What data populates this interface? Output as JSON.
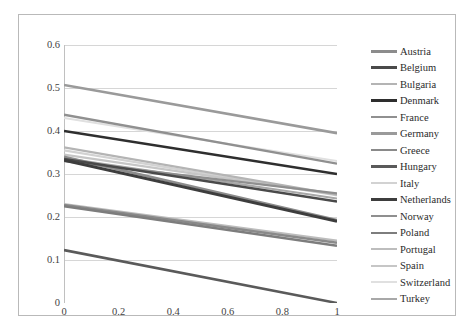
{
  "chart_data": {
    "type": "line",
    "title": "",
    "subtitle": "",
    "xlabel": "",
    "ylabel": "",
    "xlim": [
      0,
      1
    ],
    "ylim": [
      0,
      0.6
    ],
    "x_ticks": [
      "0",
      "0.2",
      "0.4",
      "0.6",
      "0.8",
      "1"
    ],
    "x_tick_values": [
      0,
      0.2,
      0.4,
      0.6,
      0.8,
      1
    ],
    "y_ticks": [
      "0",
      "0.1",
      "0.2",
      "0.3",
      "0.4",
      "0.5",
      "0.6"
    ],
    "y_tick_values": [
      0,
      0.1,
      0.2,
      0.3,
      0.4,
      0.5,
      0.6
    ],
    "grid": "horizontal",
    "legend_position": "right",
    "x": [
      0,
      1
    ],
    "series": [
      {
        "name": "Austria",
        "color": "#8c8c8c",
        "width": 2.6,
        "values": [
          0.34,
          0.193
        ]
      },
      {
        "name": "Belgium",
        "color": "#4a4a4a",
        "width": 2.6,
        "values": [
          0.335,
          0.236
        ]
      },
      {
        "name": "Bulgaria",
        "color": "#b4b4b4",
        "width": 2.2,
        "values": [
          0.362,
          0.252
        ]
      },
      {
        "name": "Denmark",
        "color": "#2e2e2e",
        "width": 2.6,
        "values": [
          0.4,
          0.3
        ]
      },
      {
        "name": "France",
        "color": "#909090",
        "width": 2.4,
        "values": [
          0.438,
          0.324
        ]
      },
      {
        "name": "Germany",
        "color": "#9a9a9a",
        "width": 2.6,
        "values": [
          0.507,
          0.395
        ]
      },
      {
        "name": "Greece",
        "color": "#8a8a8a",
        "width": 2.4,
        "values": [
          0.228,
          0.14
        ]
      },
      {
        "name": "Hungary",
        "color": "#5a5a5a",
        "width": 2.6,
        "values": [
          0.123,
          0.0
        ]
      },
      {
        "name": "Italy",
        "color": "#d2d2d2",
        "width": 2.2,
        "values": [
          0.355,
          0.25
        ]
      },
      {
        "name": "Netherlands",
        "color": "#3d3d3d",
        "width": 2.8,
        "values": [
          0.332,
          0.19
        ]
      },
      {
        "name": "Norway",
        "color": "#8f8f8f",
        "width": 2.2,
        "values": [
          0.33,
          0.255
        ]
      },
      {
        "name": "Poland",
        "color": "#7d7d7d",
        "width": 2.4,
        "values": [
          0.225,
          0.133
        ]
      },
      {
        "name": "Portugal",
        "color": "#bdbdbd",
        "width": 2.2,
        "values": [
          0.23,
          0.145
        ]
      },
      {
        "name": "Spain",
        "color": "#c6c6c6",
        "width": 2.2,
        "values": [
          0.345,
          0.252
        ]
      },
      {
        "name": "Switzerland",
        "color": "#e0e0e0",
        "width": 2.0,
        "values": [
          0.43,
          0.33
        ]
      },
      {
        "name": "Turkey",
        "color": "#a8a8a8",
        "width": 2.2,
        "values": [
          0.337,
          0.243
        ]
      }
    ]
  },
  "axes": {
    "y_ticks": [
      "0.6",
      "0.5",
      "0.4",
      "0.3",
      "0.2",
      "0.1",
      "0"
    ],
    "x_ticks": [
      "0",
      "0.2",
      "0.4",
      "0.6",
      "0.8",
      "1"
    ]
  },
  "legend": {
    "items": [
      {
        "label": "Austria"
      },
      {
        "label": "Belgium"
      },
      {
        "label": "Bulgaria"
      },
      {
        "label": "Denmark"
      },
      {
        "label": "France"
      },
      {
        "label": "Germany"
      },
      {
        "label": "Greece"
      },
      {
        "label": "Hungary"
      },
      {
        "label": "Italy"
      },
      {
        "label": "Netherlands"
      },
      {
        "label": "Norway"
      },
      {
        "label": "Poland"
      },
      {
        "label": "Portugal"
      },
      {
        "label": "Spain"
      },
      {
        "label": "Switzerland"
      },
      {
        "label": "Turkey"
      }
    ]
  },
  "style": {
    "background": "#ffffff",
    "frame_color": "#b9b9b9",
    "grid_color": "#d6d6d6",
    "axis_color": "#c0c0c0",
    "tick_text_color": "#3f3f3f"
  }
}
